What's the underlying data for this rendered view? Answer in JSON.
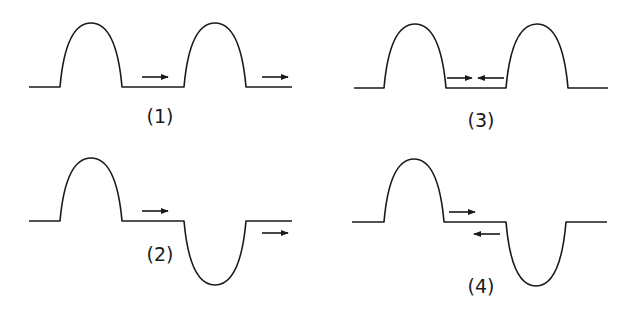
{
  "diagram": {
    "stroke_color": "#1a1a1a",
    "panels": [
      {
        "id": "1",
        "label": "(1)",
        "baseline_y": 87,
        "x_start": 29,
        "x_end": 292,
        "pulses": [
          {
            "orientation": "up",
            "x0": 60,
            "x1": 122,
            "extreme_y": 23
          },
          {
            "orientation": "up",
            "x0": 184,
            "x1": 246,
            "extreme_y": 23
          }
        ],
        "arrows": [
          {
            "direction": "right",
            "x0": 142,
            "x1": 168,
            "y": 77
          },
          {
            "direction": "right",
            "x0": 262,
            "x1": 288,
            "y": 77
          }
        ],
        "label_pos": {
          "x": 160,
          "y": 116
        }
      },
      {
        "id": "2",
        "label": "(2)",
        "baseline_y": 221,
        "x_start": 29,
        "x_end": 292,
        "pulses": [
          {
            "orientation": "up",
            "x0": 60,
            "x1": 122,
            "extreme_y": 158
          },
          {
            "orientation": "down",
            "x0": 184,
            "x1": 246,
            "extreme_y": 285
          }
        ],
        "arrows": [
          {
            "direction": "right",
            "x0": 142,
            "x1": 168,
            "y": 211
          },
          {
            "direction": "right",
            "x0": 262,
            "x1": 288,
            "y": 233
          }
        ],
        "label_pos": {
          "x": 160,
          "y": 254
        }
      },
      {
        "id": "3",
        "label": "(3)",
        "baseline_y": 88,
        "x_start": 354,
        "x_end": 608,
        "pulses": [
          {
            "orientation": "up",
            "x0": 384,
            "x1": 446,
            "extreme_y": 24
          },
          {
            "orientation": "up",
            "x0": 506,
            "x1": 568,
            "extreme_y": 24
          }
        ],
        "arrows": [
          {
            "direction": "right",
            "x0": 447,
            "x1": 472,
            "y": 78
          },
          {
            "direction": "left",
            "x0": 478,
            "x1": 504,
            "y": 78
          }
        ],
        "label_pos": {
          "x": 481,
          "y": 120
        }
      },
      {
        "id": "4",
        "label": "(4)",
        "baseline_y": 222,
        "x_start": 352,
        "x_end": 607,
        "pulses": [
          {
            "orientation": "up",
            "x0": 384,
            "x1": 444,
            "extreme_y": 159
          },
          {
            "orientation": "down",
            "x0": 506,
            "x1": 566,
            "extreme_y": 286
          }
        ],
        "arrows": [
          {
            "direction": "right",
            "x0": 449,
            "x1": 475,
            "y": 212
          },
          {
            "direction": "left",
            "x0": 474,
            "x1": 500,
            "y": 234
          }
        ],
        "label_pos": {
          "x": 481,
          "y": 286
        }
      }
    ]
  }
}
